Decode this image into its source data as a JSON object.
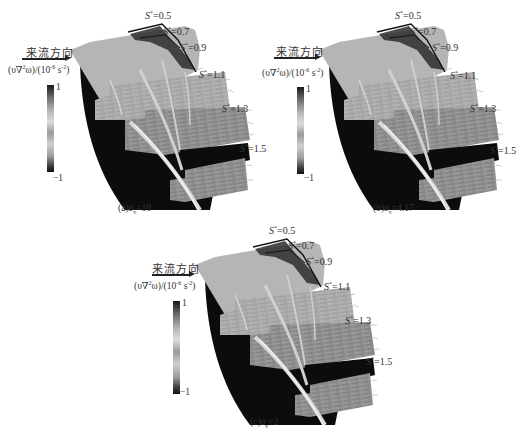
{
  "figure": {
    "flow_direction_label": "来流方向",
    "colorbar": {
      "quantity": "(υ∇²ω)/(10⁻⁶ s⁻²)",
      "quantity_prefix": "(υ∇",
      "quantity_mid": "ω)/(10",
      "quantity_exp1": "2",
      "quantity_exp2": "-6",
      "quantity_unit": " s",
      "quantity_exp3": "-2",
      "quantity_suffix": ")",
      "max_label": "1",
      "min_label": "−1",
      "gradient": [
        "#1a1a1a",
        "#6a6a6a",
        "#b8b8b8",
        "#dcdcdc",
        "#9a9a9a",
        "#cfcfcf",
        "#9c9c9c",
        "#3c3c3c",
        "#111111"
      ]
    },
    "section_symbol": "S",
    "section_sup": "*",
    "sections": [
      "=0.5",
      "=0.7",
      "=0.9",
      "=1.1",
      "=1.3",
      "=1.5"
    ],
    "panels": [
      {
        "id": "a",
        "caption_prefix": "(a)",
        "sigma": "σ",
        "sigma_sub": "v",
        "caption_value": "=10"
      },
      {
        "id": "b",
        "caption_prefix": "(b)",
        "sigma": "σ",
        "sigma_sub": "v",
        "caption_value": "=4.17"
      },
      {
        "id": "c",
        "caption_prefix": "(c)",
        "sigma": "σ",
        "sigma_sub": "v",
        "caption_value": "=2"
      }
    ]
  }
}
